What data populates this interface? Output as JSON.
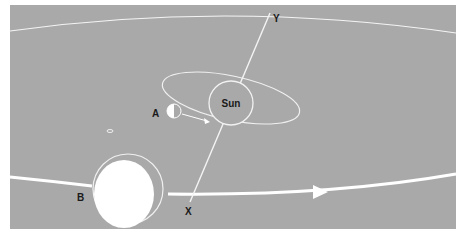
{
  "diagram": {
    "labels": {
      "sun": "Sun",
      "a": "A",
      "b": "B",
      "x": "X",
      "y": "Y"
    },
    "colors": {
      "background": "#a9a9a9",
      "lines": "#ffffff",
      "text": "#1a1a1a"
    }
  }
}
